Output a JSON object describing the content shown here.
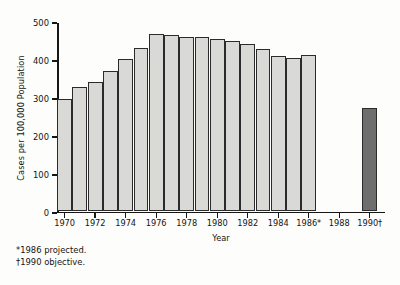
{
  "chart_data": {
    "type": "bar",
    "title": "",
    "xlabel": "Year",
    "ylabel": "Cases per 100,000 Population",
    "ylim": [
      0,
      500
    ],
    "yticks": [
      0,
      100,
      200,
      300,
      400,
      500
    ],
    "ytick_labels": [
      "0",
      "100",
      "200",
      "300",
      "400",
      "500"
    ],
    "xlim": [
      1969.5,
      1991.0
    ],
    "xtick_labels": [
      "1970",
      "1972",
      "1974",
      "1976",
      "1978",
      "1980",
      "1982",
      "1984",
      "1986*",
      "1988",
      "1990†"
    ],
    "xtick_values": [
      1970,
      1972,
      1974,
      1976,
      1978,
      1980,
      1982,
      1984,
      1986,
      1988,
      1990
    ],
    "grid": false,
    "legend": null,
    "categories": [
      1970,
      1971,
      1972,
      1973,
      1974,
      1975,
      1976,
      1977,
      1978,
      1979,
      1980,
      1981,
      1982,
      1983,
      1984,
      1985,
      1986,
      1990
    ],
    "values": [
      297,
      327,
      340,
      370,
      402,
      430,
      467,
      465,
      460,
      460,
      455,
      448,
      440,
      428,
      410,
      405,
      412,
      272
    ],
    "bar_styles": [
      "light",
      "light",
      "light",
      "light",
      "light",
      "light",
      "light",
      "light",
      "light",
      "light",
      "light",
      "light",
      "light",
      "light",
      "light",
      "light",
      "light",
      "dark"
    ],
    "series": [
      {
        "name": "Cases per 100,000 Population",
        "values": [
          297,
          327,
          340,
          370,
          402,
          430,
          467,
          465,
          460,
          460,
          455,
          448,
          440,
          428,
          410,
          405,
          412,
          272
        ]
      }
    ],
    "annotations": [
      "*1986 projected.",
      "†1990 objective."
    ],
    "colors": {
      "bar_light_fill": "#d9d9d6",
      "bar_dark_fill": "#6e6e6e",
      "bar_edge": "#2b2b2b",
      "axis": "#161616",
      "text": "#141414",
      "background": "#fdfdfb"
    }
  },
  "footnotes": {
    "projected": "*1986 projected.",
    "objective": "†1990 objective."
  }
}
